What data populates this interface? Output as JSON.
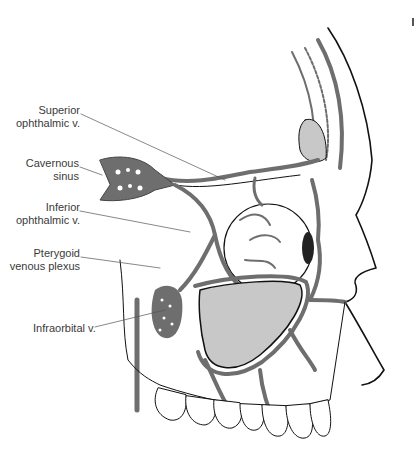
{
  "figure": {
    "colors": {
      "vein": "#6e6e6e",
      "outline": "#111111",
      "sinus_fill": "#c8c8c8",
      "background": "#ffffff",
      "label_text": "#3a3a3a",
      "leader_line": "#555555"
    }
  },
  "labels": [
    {
      "id": "superior-ophthalmic-v",
      "lines": [
        "Superior",
        "ophthalmic v."
      ]
    },
    {
      "id": "cavernous-sinus",
      "lines": [
        "Cavernous",
        "sinus"
      ]
    },
    {
      "id": "inferior-ophthalmic-v",
      "lines": [
        "Inferior",
        "ophthalmic v."
      ]
    },
    {
      "id": "pterygoid-venous-plexus",
      "lines": [
        "Pterygoid",
        "venous plexus"
      ]
    },
    {
      "id": "infraorbital-v",
      "lines": [
        "Infraorbital v."
      ]
    }
  ]
}
